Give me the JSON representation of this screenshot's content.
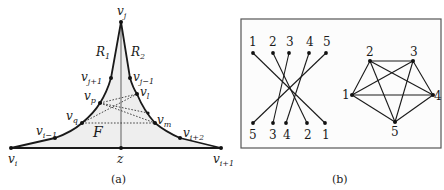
{
  "panel_a": {
    "caption": "(a)",
    "region_labels": {
      "R1": "R",
      "R1_sub": "1",
      "R2": "R",
      "R2_sub": "2",
      "F": "F"
    },
    "vertices": {
      "vj": {
        "base": "v",
        "sub": "j"
      },
      "vj_plus_1": {
        "base": "v",
        "sub": "j+1"
      },
      "vj_minus_1": {
        "base": "v",
        "sub": "j−1"
      },
      "vp": {
        "base": "v",
        "sub": "p"
      },
      "vl": {
        "base": "v",
        "sub": "l"
      },
      "vq": {
        "base": "v",
        "sub": "q"
      },
      "vm": {
        "base": "v",
        "sub": "m"
      },
      "vi_minus_1": {
        "base": "v",
        "sub": "i−1"
      },
      "vi_plus_2": {
        "base": "v",
        "sub": "i+2"
      },
      "vi": {
        "base": "v",
        "sub": "i"
      },
      "vi_plus_1": {
        "base": "v",
        "sub": "i+1"
      },
      "z": {
        "base": "z",
        "sub": ""
      }
    },
    "colors": {
      "edge": "#1a1a1a",
      "shade": "#ececec",
      "dotted": "#333333",
      "axis": "#666666"
    }
  },
  "panel_b": {
    "caption": "(b)",
    "bipartite": {
      "top_labels": [
        "1",
        "2",
        "3",
        "4",
        "5"
      ],
      "bottom_labels": [
        "5",
        "3",
        "4",
        "2",
        "1"
      ]
    },
    "complete_graph": {
      "labels": [
        "1",
        "2",
        "3",
        "4",
        "5"
      ]
    },
    "colors": {
      "border": "#555555",
      "edge": "#1a1a1a"
    }
  }
}
